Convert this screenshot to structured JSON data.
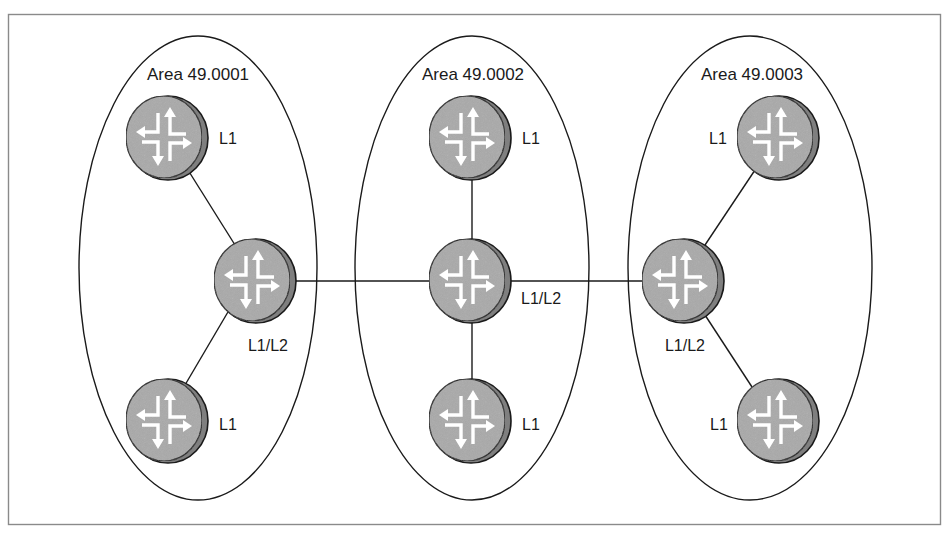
{
  "diagram": {
    "type": "network-topology",
    "colors": {
      "frame": "#8a8a8a",
      "ellipse": "#1a1a1a",
      "link": "#1a1a1a",
      "router_fill": "#a9a9a9",
      "router_rim": "#7f7f7f",
      "router_arrows": "#ffffff",
      "text": "#1a1a1a"
    },
    "areas": [
      {
        "id": "area1",
        "label": "Area 49.0001"
      },
      {
        "id": "area2",
        "label": "Area 49.0002"
      },
      {
        "id": "area3",
        "label": "Area 49.0003"
      }
    ],
    "routers": [
      {
        "id": "a1-top",
        "area": "area1",
        "level": "L1"
      },
      {
        "id": "a1-core",
        "area": "area1",
        "level": "L1/L2"
      },
      {
        "id": "a1-bottom",
        "area": "area1",
        "level": "L1"
      },
      {
        "id": "a2-top",
        "area": "area2",
        "level": "L1"
      },
      {
        "id": "a2-core",
        "area": "area2",
        "level": "L1/L2"
      },
      {
        "id": "a2-bottom",
        "area": "area2",
        "level": "L1"
      },
      {
        "id": "a3-top",
        "area": "area3",
        "level": "L1"
      },
      {
        "id": "a3-core",
        "area": "area3",
        "level": "L1/L2"
      },
      {
        "id": "a3-bottom",
        "area": "area3",
        "level": "L1"
      }
    ],
    "links": [
      [
        "a1-top",
        "a1-core"
      ],
      [
        "a1-core",
        "a1-bottom"
      ],
      [
        "a1-core",
        "a2-core"
      ],
      [
        "a2-top",
        "a2-core"
      ],
      [
        "a2-core",
        "a2-bottom"
      ],
      [
        "a2-core",
        "a3-core"
      ],
      [
        "a3-core",
        "a3-top"
      ],
      [
        "a3-core",
        "a3-bottom"
      ]
    ]
  }
}
